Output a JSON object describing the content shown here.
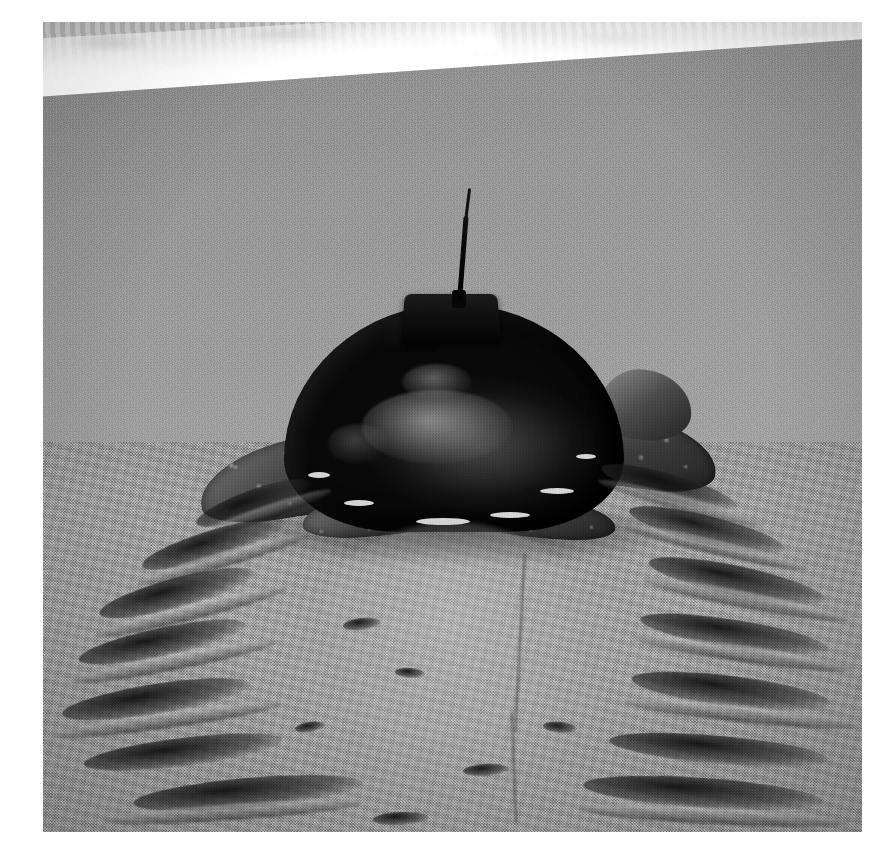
{
  "page": {
    "background_color": "#ffffff",
    "width": 896,
    "height": 862
  },
  "photo": {
    "name": "sea-turtle-with-satellite-transmitter-on-beach",
    "medium": "black-and-white photograph",
    "frame": {
      "left": 43,
      "top": 22,
      "width": 819,
      "height": 810
    },
    "orientation": "landscape-crop, near square",
    "caption_visible": false
  },
  "scene": {
    "subject": "sea turtle",
    "setting": "sandy beach at the water's edge",
    "description": "A large sea turtle faces away from the camera, crawling up a wet sand beach toward the viewer's bottom of frame, with a satellite transmitter and whip antenna attached to the top of its carapace. Surf foam runs across the top of the frame and turtle crawl tracks with flipper gouges trail down the sand.",
    "tone_palette": {
      "surf_foam_white": "#ffffff",
      "water_gray": "#c6c6c6",
      "wet_sand_gray": "#9a9a9a",
      "dry_sand_gray": "#a9a9a9",
      "carapace_dark": "#161616",
      "track_shadow": "#1c1c1c"
    }
  },
  "elements": {
    "surf": {
      "label": "breaking surf and foam line",
      "position": "top of frame"
    },
    "waterline": {
      "label": "wet foam edge",
      "slope": "rises left to right"
    },
    "wet_sand": {
      "label": "smooth wet sand flat",
      "position": "upper middle"
    },
    "dry_sand": {
      "label": "grainy dry sand",
      "position": "lower half"
    },
    "turtle": {
      "label": "sea turtle",
      "carapace": "dark domed shell with algae and barnacle patches",
      "front_left_flipper": "front left flipper with mottled scales",
      "front_right_flipper": "front right flipper with mottled scales",
      "rear_left_flipper": "rear left flipper",
      "rear_right_flipper": "rear right flipper",
      "head": "head turned slightly to the right"
    },
    "transmitter": {
      "label": "satellite transmitter tag",
      "mount": "epoxied to top center of carapace",
      "antenna": "thin whip antenna angled slightly right"
    },
    "tracks": {
      "label": "turtle crawl tracks",
      "left_flipper_marks": "diagonal gouge marks on left side of trail",
      "right_flipper_marks": "diagonal gouge marks on right side of trail",
      "center": "smoothed plastron drag down the middle",
      "tail_drag": "faint central tail drag line"
    }
  }
}
